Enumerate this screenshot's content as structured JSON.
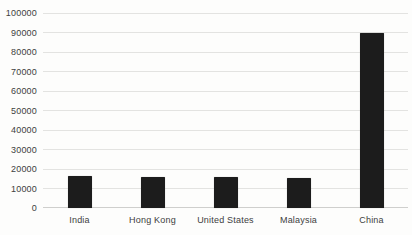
{
  "chart_data": {
    "type": "bar",
    "title": "",
    "xlabel": "",
    "ylabel": "",
    "categories": [
      "India",
      "Hong Kong",
      "United States",
      "Malaysia",
      "China"
    ],
    "values": [
      16500,
      16000,
      15800,
      15400,
      89500
    ],
    "ylim": [
      0,
      100000
    ],
    "ytick_interval": 10000,
    "ytick_labels": [
      "0",
      "10000",
      "20000",
      "30000",
      "40000",
      "50000",
      "60000",
      "70000",
      "80000",
      "90000",
      "100000"
    ],
    "grid": "horizontal-only",
    "legend": "none",
    "colors": {
      "bar": "#1c1c1c",
      "gridline": "#e3e3e1",
      "axis_baseline": "#cfcfcd",
      "tick_text": "#404040",
      "background": "#fdfdfc"
    }
  }
}
